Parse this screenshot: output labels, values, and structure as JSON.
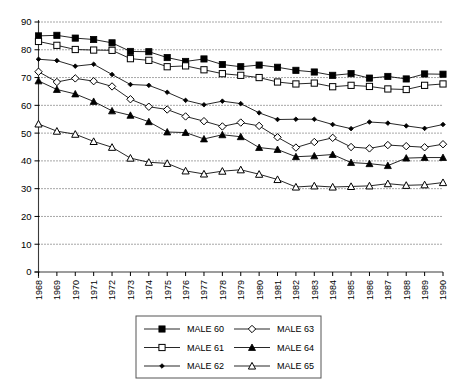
{
  "chart_data": {
    "type": "line",
    "title": "",
    "subtitle": "",
    "xlabel": "",
    "ylabel": "",
    "xlim": [
      1968,
      1990
    ],
    "ylim": [
      0,
      90
    ],
    "ytick_interval": 10,
    "grid": true,
    "grid_style": "dotted-horizontal",
    "legend_position": "bottom-center",
    "legend_columns": 2,
    "x": [
      1968,
      1969,
      1970,
      1971,
      1972,
      1973,
      1974,
      1975,
      1976,
      1977,
      1978,
      1979,
      1980,
      1981,
      1982,
      1983,
      1984,
      1985,
      1986,
      1987,
      1988,
      1989,
      1990
    ],
    "categories": [
      "1968",
      "1969",
      "1970",
      "1971",
      "1972",
      "1973",
      "1974",
      "1975",
      "1976",
      "1977",
      "1978",
      "1979",
      "1980",
      "1981",
      "1982",
      "1983",
      "1984",
      "1985",
      "1986",
      "1987",
      "1988",
      "1989",
      "1990"
    ],
    "yticks": [
      0,
      10,
      20,
      30,
      40,
      50,
      60,
      70,
      80,
      90
    ],
    "ytick_labels": [
      "0",
      "10",
      "20",
      "30",
      "40",
      "50",
      "60",
      "70",
      "80",
      "90"
    ],
    "series": [
      {
        "name": "MALE 60",
        "marker": "filled-square",
        "values": [
          85.0,
          85.2,
          84.2,
          83.7,
          82.5,
          79.4,
          79.3,
          77.2,
          75.8,
          76.7,
          74.7,
          73.9,
          74.5,
          73.7,
          72.6,
          72.0,
          70.8,
          71.4,
          69.8,
          70.4,
          69.5,
          71.3,
          71.2
        ]
      },
      {
        "name": "MALE 61",
        "marker": "open-square",
        "values": [
          83.0,
          81.6,
          80.1,
          79.9,
          79.8,
          76.8,
          76.2,
          73.9,
          74.2,
          72.8,
          71.4,
          70.8,
          70.0,
          68.4,
          67.7,
          68.0,
          66.7,
          67.2,
          66.8,
          65.9,
          65.7,
          67.2,
          67.7
        ]
      },
      {
        "name": "MALE 62",
        "marker": "small-filled-diamond",
        "values": [
          76.6,
          76.1,
          74.1,
          74.8,
          71.1,
          67.5,
          67.2,
          64.7,
          61.8,
          60.2,
          61.5,
          60.6,
          57.3,
          54.9,
          55.0,
          55.0,
          53.1,
          51.6,
          54.0,
          53.6,
          52.6,
          51.7,
          53.1
        ]
      },
      {
        "name": "MALE 63",
        "marker": "open-diamond",
        "values": [
          72.1,
          68.4,
          69.7,
          68.7,
          66.8,
          62.2,
          59.5,
          58.5,
          56.0,
          54.3,
          52.4,
          53.8,
          52.6,
          48.5,
          44.8,
          46.8,
          48.3,
          45.0,
          44.5,
          45.7,
          45.3,
          44.9,
          46.0
        ]
      },
      {
        "name": "MALE 64",
        "marker": "filled-triangle",
        "values": [
          68.8,
          65.7,
          64.1,
          61.4,
          58.0,
          56.4,
          54.1,
          50.4,
          50.2,
          47.9,
          49.4,
          48.7,
          44.8,
          44.1,
          41.5,
          41.8,
          42.3,
          39.4,
          39.0,
          38.3,
          41.0,
          41.2,
          41.2
        ]
      },
      {
        "name": "MALE 65",
        "marker": "open-triangle",
        "values": [
          53.3,
          50.7,
          49.6,
          47.0,
          44.9,
          41.0,
          39.5,
          39.1,
          36.4,
          35.3,
          36.3,
          36.8,
          35.2,
          33.3,
          30.6,
          31.0,
          30.6,
          30.8,
          31.0,
          31.8,
          31.2,
          31.4,
          32.2
        ]
      }
    ]
  },
  "legend": {
    "entries": [
      {
        "label": "MALE 60",
        "marker": "filled-square"
      },
      {
        "label": "MALE 63",
        "marker": "open-diamond"
      },
      {
        "label": "MALE 61",
        "marker": "open-square"
      },
      {
        "label": "MALE 64",
        "marker": "filled-triangle"
      },
      {
        "label": "MALE 62",
        "marker": "small-filled-diamond"
      },
      {
        "label": "MALE 65",
        "marker": "open-triangle"
      }
    ]
  },
  "colors": {
    "line": "#000000",
    "grid": "#000000",
    "axis": "#3a3a3a",
    "background": "#ffffff",
    "legend_border": "#555555"
  }
}
